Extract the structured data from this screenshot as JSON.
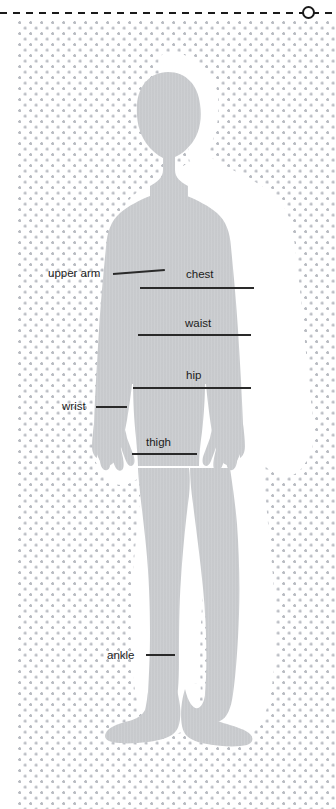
{
  "page": {
    "background_color": "#ffffff",
    "dot_color": "#b9bcc2",
    "body_fill": "#c8cacc",
    "line_color": "#2a2a2a",
    "text_color": "#1c1c1c"
  },
  "cut_guide": {
    "name": "dashed-cut-line",
    "marker": "circle-cut-marker"
  },
  "figure": {
    "name": "child-body-silhouette"
  },
  "measurements": [
    {
      "id": "upper-arm",
      "label": "upper arm",
      "label_x": 48,
      "label_y": 268,
      "line": {
        "x": 113,
        "y": 273,
        "width": 52,
        "angle": -4.5
      },
      "side": "left"
    },
    {
      "id": "chest",
      "label": "chest",
      "label_x": 186,
      "label_y": 269,
      "line": {
        "x": 140,
        "y": 287,
        "width": 114,
        "angle": 0
      },
      "side": "center"
    },
    {
      "id": "waist",
      "label": "waist",
      "label_x": 185,
      "label_y": 318,
      "line": {
        "x": 138,
        "y": 334,
        "width": 113,
        "angle": 0
      },
      "side": "center"
    },
    {
      "id": "hip",
      "label": "hip",
      "label_x": 186,
      "label_y": 370,
      "line": {
        "x": 133,
        "y": 387,
        "width": 118,
        "angle": 0
      },
      "side": "center"
    },
    {
      "id": "wrist",
      "label": "wrist",
      "label_x": 62,
      "label_y": 401,
      "line": {
        "x": 96,
        "y": 406,
        "width": 31,
        "angle": 0
      },
      "side": "left"
    },
    {
      "id": "thigh",
      "label": "thigh",
      "label_x": 146,
      "label_y": 437,
      "line": {
        "x": 132,
        "y": 453,
        "width": 65,
        "angle": 0
      },
      "side": "center"
    },
    {
      "id": "ankle",
      "label": "ankle",
      "label_x": 107,
      "label_y": 650,
      "line": {
        "x": 146,
        "y": 654,
        "width": 29,
        "angle": 0
      },
      "side": "center"
    }
  ]
}
